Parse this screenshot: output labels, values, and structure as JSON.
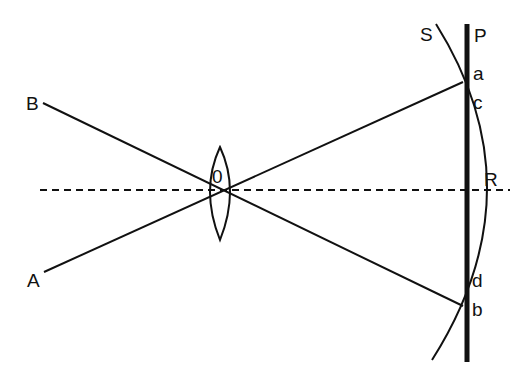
{
  "diagram": {
    "type": "optics-lens-image-formation",
    "colors": {
      "ink": "#111111",
      "background": "#ffffff"
    },
    "labels": {
      "A": "A",
      "B": "B",
      "O": "0",
      "S": "S",
      "P": "P",
      "a": "a",
      "c": "c",
      "R": "R",
      "d": "d",
      "b": "b"
    },
    "elements": {
      "optical_axis": "dashed horizontal line",
      "lens": "biconvex lens centered at O",
      "ray_B": "line from B through O to b",
      "ray_A": "line from A through O to a",
      "plane_P": "thick vertical line",
      "surface_S": "curved image surface through a, R, b"
    }
  }
}
